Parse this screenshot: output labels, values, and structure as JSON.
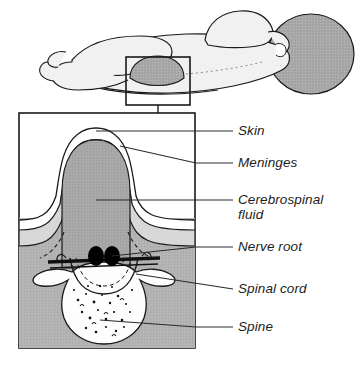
{
  "figure": {
    "overview_caption": "Infant lying prone with lumbar lesion",
    "detail_caption": "Magnified cross-section of the spinal defect"
  },
  "callout": {
    "inset_box_name": "lesion-inset-box",
    "connector_name": "inset-connector-line"
  },
  "labels": [
    {
      "id": "skin",
      "text": "Skin",
      "x": 238,
      "y": 123,
      "leader_y": 131,
      "leader_x1": 196,
      "leader_x2": 233
    },
    {
      "id": "meninges",
      "text": "Meninges",
      "x": 238,
      "y": 155,
      "leader_y": 163,
      "leader_x1": 196,
      "leader_x2": 233
    },
    {
      "id": "csf",
      "text": "Cerebrospinal\nfluid",
      "x": 238,
      "y": 192,
      "leader_y": 200,
      "leader_x1": 196,
      "leader_x2": 233
    },
    {
      "id": "nerve-root",
      "text": "Nerve root",
      "x": 238,
      "y": 239,
      "leader_y": 247,
      "leader_x1": 196,
      "leader_x2": 233
    },
    {
      "id": "spinal-cord",
      "text": "Spinal cord",
      "x": 238,
      "y": 281,
      "leader_y": 289,
      "leader_x1": 196,
      "leader_x2": 233
    },
    {
      "id": "spine",
      "text": "Spine",
      "x": 238,
      "y": 319,
      "leader_y": 327,
      "leader_x1": 196,
      "leader_x2": 233
    }
  ],
  "colors": {
    "outline": "#1a1a1a",
    "body_fill": "#f2f2f2",
    "lesion_fill": "#a9a9a9",
    "head_fill": "#a5a5a5",
    "tissue_fill": "#b4b4b4",
    "csf_fill": "#a8a8a8",
    "meninges_band": "#d8d8d8",
    "bone_fill": "#fdfdfd",
    "nerve_root_fill": "#000000",
    "leader_line": "#2a2a2a",
    "text": "#1d1d1d",
    "page_background": "#ffffff"
  },
  "anatomy": {
    "overview_parts": [
      "head",
      "arm",
      "torso",
      "legs",
      "feet",
      "lesion-dome"
    ],
    "detail_parts": [
      "skin-outer-layer",
      "meninges-layer",
      "cerebrospinal-fluid-sac",
      "nerve-roots",
      "spinal-cord",
      "vertebra-bone",
      "defect-margin-dashed"
    ]
  }
}
